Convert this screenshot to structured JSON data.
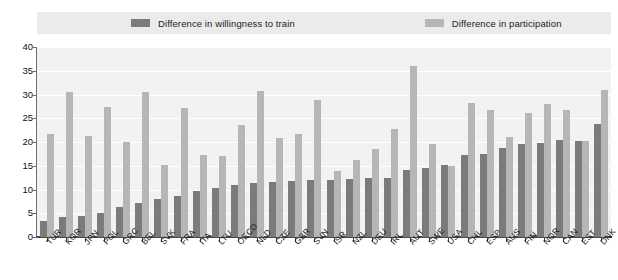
{
  "chart_data": {
    "type": "bar",
    "title": "",
    "xlabel": "",
    "ylabel": "",
    "ylim": [
      0,
      40
    ],
    "yticks": [
      0,
      5,
      10,
      15,
      20,
      25,
      30,
      35,
      40
    ],
    "grid": true,
    "legend_position": "top",
    "categories": [
      "TUR",
      "KOR",
      "JPN",
      "POL",
      "GRC",
      "BEL",
      "SVK",
      "FRA",
      "ITA",
      "LTU",
      "OECD",
      "NLD",
      "CZE",
      "GBR",
      "SVN",
      "ISR",
      "NZL",
      "DEU",
      "IRL",
      "AUT",
      "SWE",
      "USA",
      "CHL",
      "ESP",
      "AUS",
      "FIN",
      "NOR",
      "CAN",
      "EST",
      "DNK"
    ],
    "series": [
      {
        "name": "Difference in willingness to train",
        "color": "#7b7b7b",
        "values": [
          3.3,
          4.2,
          4.4,
          5.1,
          6.3,
          7.2,
          8.0,
          8.6,
          9.7,
          10.3,
          11.0,
          11.3,
          11.5,
          11.7,
          11.9,
          12.0,
          12.3,
          12.4,
          12.5,
          14.2,
          14.5,
          15.2,
          17.2,
          17.5,
          18.8,
          19.5,
          19.8,
          20.5,
          20.2,
          23.7
        ]
      },
      {
        "name": "Difference in participation",
        "color": "#b6b6b6",
        "values": [
          21.7,
          30.5,
          21.3,
          27.3,
          20.0,
          30.5,
          15.2,
          27.2,
          17.3,
          17.1,
          23.5,
          30.8,
          20.8,
          21.7,
          28.9,
          13.8,
          16.2,
          18.5,
          22.8,
          36.0,
          19.6,
          15.0,
          28.2,
          26.8,
          21.1,
          26.2,
          28.0,
          26.8,
          20.2,
          31.0
        ]
      }
    ]
  },
  "legend": {
    "entries": [
      {
        "label": "Difference in willingness to train",
        "color": "#7b7b7b"
      },
      {
        "label": "Difference in participation",
        "color": "#b6b6b6"
      }
    ]
  },
  "axis": {
    "y_tick_labels": [
      "40",
      "35",
      "30",
      "25",
      "20",
      "15",
      "10",
      "5",
      "0"
    ]
  }
}
